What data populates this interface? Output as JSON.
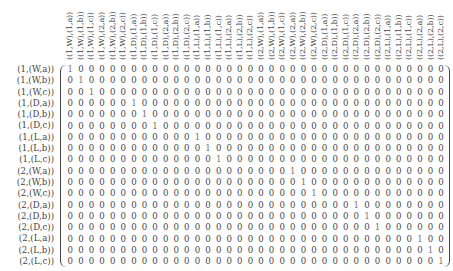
{
  "matrix": {
    "column_labels": [
      "((1,W),(1,a))",
      "((1,W),(1,b))",
      "((1,W),(1,c))",
      "((1,W),(2,a))",
      "((1,W),(2,b))",
      "((1,W),(2,c))",
      "((1,D),(1,a))",
      "((1,D),(1,b))",
      "((1,D),(1,c))",
      "((1,D),(2,a))",
      "((1,D),(2,b))",
      "((1,D),(2,c))",
      "((1,L),(1,a))",
      "((1,L),(1,b))",
      "((1,L),(1,c))",
      "((1,L),(2,a))",
      "((1,L),(2,b))",
      "((1,L),(2,c))",
      "((2,W),(1,a))",
      "((2,W),(1,b))",
      "((2,W),(1,c))",
      "((2,W),(2,a))",
      "((2,W),(2,b))",
      "((2,W),(2,c))",
      "((2,D),(1,a))",
      "((2,D),(1,b))",
      "((2,D),(1,c))",
      "((2,D),(2,a))",
      "((2,D),(2,b))",
      "((2,D),(2,c))",
      "((2,L),(1,a))",
      "((2,L),(1,b))",
      "((2,L),(1,c))",
      "((2,L),(2,a))",
      "((2,L),(2,b))",
      "((2,L),(2,c))"
    ],
    "row_labels": [
      "(1,(W,a))",
      "(1,(W,b))",
      "(1,(W,c))",
      "(1,(D,a))",
      "(1,(D,b))",
      "(1,(D,c))",
      "(1,(L,a))",
      "(1,(L,b))",
      "(1,(L,c))",
      "(2,(W,a))",
      "(2,(W,b))",
      "(2,(W,c))",
      "(2,(D,a))",
      "(2,(D,b))",
      "(2,(D,c))",
      "(2,(L,a))",
      "(2,(L,b))",
      "(2,(L,c))"
    ],
    "ones_column_index_per_row": [
      0,
      1,
      2,
      6,
      7,
      8,
      12,
      13,
      14,
      21,
      22,
      23,
      27,
      28,
      29,
      33,
      34,
      35
    ],
    "num_columns": 36
  }
}
